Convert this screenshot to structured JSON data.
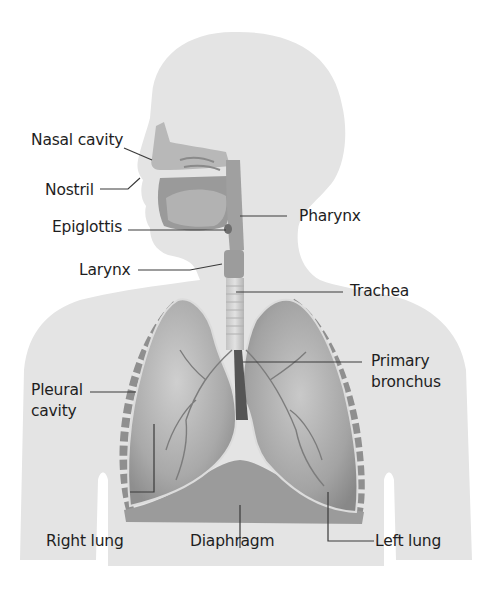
{
  "diagram": {
    "colors": {
      "background": "#ffffff",
      "silhouette": "#e4e4e4",
      "organ_dark": "#8a8a8a",
      "organ_mid": "#a8a8a8",
      "organ_light": "#c6c6c6",
      "label_text": "#1e1e1e",
      "leader_line": "#3a3a3a"
    },
    "labels": {
      "nasal_cavity": "Nasal cavity",
      "nostril": "Nostril",
      "epiglottis": "Epiglottis",
      "pharynx": "Pharynx",
      "larynx": "Larynx",
      "trachea": "Trachea",
      "primary_bronchus_line1": "Primary",
      "primary_bronchus_line2": "bronchus",
      "pleural_cavity_line1": "Pleural",
      "pleural_cavity_line2": "cavity",
      "right_lung": "Right lung",
      "diaphragm": "Diaphragm",
      "left_lung": "Left lung"
    }
  }
}
